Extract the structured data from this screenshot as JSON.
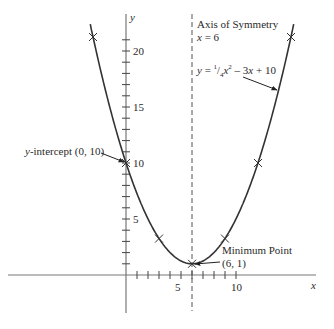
{
  "chart_data": {
    "type": "line",
    "title": "",
    "function": "y = 1/4 x^2 - 3x + 10",
    "xlabel": "x",
    "ylabel": "y",
    "xlim": [
      -3.3,
      17
    ],
    "ylim": [
      -3.5,
      22
    ],
    "x_ticks": [
      1,
      2,
      3,
      4,
      5,
      6,
      7,
      8,
      9,
      10
    ],
    "x_tick_labels": [
      {
        "value": 5,
        "label": "5"
      },
      {
        "value": 10,
        "label": "10"
      }
    ],
    "y_ticks": [
      1,
      2,
      3,
      4,
      5,
      6,
      7,
      8,
      9,
      10,
      11,
      12,
      13,
      14,
      15,
      16,
      17,
      18,
      19,
      20,
      21
    ],
    "y_tick_labels": [
      {
        "value": 5,
        "label": "5"
      },
      {
        "value": 10,
        "label": "10"
      },
      {
        "value": 15,
        "label": "15"
      },
      {
        "value": 20,
        "label": "20"
      }
    ],
    "grid": false,
    "series": [
      {
        "name": "y = 1/4 x^2 - 3x + 10",
        "x": [
          -3.2,
          -3,
          0,
          3,
          6,
          9,
          12,
          15,
          15.2
        ],
        "y": [
          22.0,
          21.25,
          10,
          3.25,
          1,
          3.25,
          10,
          21.25,
          22.0
        ]
      }
    ],
    "marked_points": [
      {
        "x": -3,
        "y": 21.25
      },
      {
        "x": 0,
        "y": 10
      },
      {
        "x": 3,
        "y": 3.25
      },
      {
        "x": 6,
        "y": 1
      },
      {
        "x": 9,
        "y": 3.25
      },
      {
        "x": 12,
        "y": 10
      },
      {
        "x": 15,
        "y": 21.25
      }
    ],
    "axis_of_symmetry": {
      "x": 6,
      "style": "dashed"
    },
    "annotations": [
      {
        "text": "Axis of Symmetry",
        "target": "x = 6"
      },
      {
        "text": "x = 6"
      },
      {
        "text": "y = 1/4 x^2 - 3x + 10",
        "target": "curve"
      },
      {
        "text": "y-intercept (0, 10)",
        "target": [
          0,
          10
        ]
      },
      {
        "text": "Minimum Point",
        "target": [
          6,
          1
        ]
      },
      {
        "text": "(6, 1)",
        "target": [
          6,
          1
        ]
      }
    ]
  },
  "labels": {
    "axis_title": "Axis of Symmetry",
    "axis_eq_var": "x",
    "axis_eq_rest": " = 6",
    "eq_y": "y",
    "eq_eq": " = ",
    "eq_num": "1",
    "eq_den": "4",
    "eq_x1": "x",
    "eq_sup": "2",
    "eq_mid": " – 3",
    "eq_x2": "x",
    "eq_end": " + 10",
    "yint_var": "y",
    "yint_text": "-intercept (0, 10)",
    "min_title": "Minimum Point",
    "min_coord": "(6, 1)",
    "x_axis_label": "x",
    "y_axis_label": "y",
    "tick_x5": "5",
    "tick_x10": "10",
    "tick_y5": "5",
    "tick_y10": "10",
    "tick_y15": "15",
    "tick_y20": "20"
  }
}
